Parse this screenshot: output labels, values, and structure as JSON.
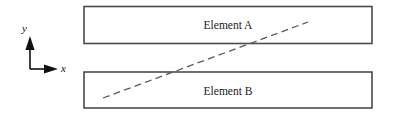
{
  "figure": {
    "background_color": "#ffffff",
    "width": 394,
    "height": 116
  },
  "axes": {
    "x_label": "x",
    "y_label": "y",
    "color": "#111111",
    "origin": {
      "x": 30,
      "y": 69
    },
    "x_arrow_tip": {
      "x": 57,
      "y": 69
    },
    "y_arrow_tip": {
      "x": 30,
      "y": 38
    },
    "x_label_pos": {
      "x": 61,
      "y": 72
    },
    "y_label_pos": {
      "x": 22,
      "y": 32
    }
  },
  "elements": [
    {
      "name": "Element A",
      "label": "Element A",
      "x": 84,
      "y": 6.5,
      "width": 288,
      "height": 37,
      "label_x": 228,
      "label_y": 29,
      "fill": "#ffffff",
      "stroke": "#4a4a4a"
    },
    {
      "name": "Element B",
      "label": "Element B",
      "x": 84,
      "y": 72,
      "width": 288,
      "height": 36,
      "label_x": 228,
      "label_y": 95,
      "fill": "#ffffff",
      "stroke": "#4a4a4a"
    }
  ],
  "crack": {
    "label": "dashed-crack-line",
    "x1": 103,
    "y1": 98,
    "x2": 308,
    "y2": 22,
    "color": "#5a5a5a",
    "dash_length": 7,
    "gap_length": 4.2,
    "stroke_width": 1.3
  }
}
